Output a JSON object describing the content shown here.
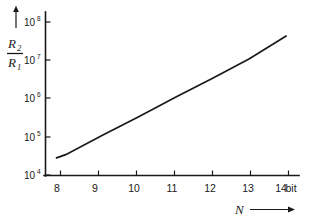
{
  "chart_data": {
    "type": "line",
    "title": "",
    "subtitle": "",
    "xlabel": "N",
    "xlabel_unit": "bit",
    "ylabel": "R2/R1",
    "ylabel_numerator": "R",
    "ylabel_numerator_sub": "2",
    "ylabel_denominator": "R",
    "ylabel_denominator_sub": "1",
    "yscale": "log",
    "xscale": "linear",
    "xlim": [
      7.45,
      14.35
    ],
    "ylim": [
      10000,
      100000000
    ],
    "grid": false,
    "legend": false,
    "legend_position": "none",
    "x_ticks": [
      8,
      9,
      10,
      11,
      12,
      13,
      14
    ],
    "x_tick_labels": [
      "8",
      "9",
      "10",
      "11",
      "12",
      "13",
      "14"
    ],
    "y_ticks": [
      10000,
      100000,
      1000000,
      10000000,
      100000000
    ],
    "y_tick_mantissa": [
      "10",
      "10",
      "10",
      "10",
      "10"
    ],
    "y_tick_exponents": [
      "4",
      "5",
      "6",
      "7",
      "8"
    ],
    "series": [
      {
        "name": "R2/R1 vs N",
        "color": "#1a1a1a",
        "x": [
          7.75,
          8,
          9,
          10,
          11,
          12,
          13,
          14
        ],
        "values": [
          28000,
          34000,
          110000,
          340000,
          1100000,
          3400000,
          11000000,
          43000000
        ]
      }
    ],
    "annotations": [
      {
        "name": "y-axis-up-arrow",
        "text": "↑"
      },
      {
        "name": "x-axis-right-arrow",
        "text": "→"
      }
    ]
  },
  "axis_labels": {
    "y_top_mantissa": "10",
    "y_top_exp": "8",
    "x_unit": "bit",
    "x_symbol": "N"
  }
}
